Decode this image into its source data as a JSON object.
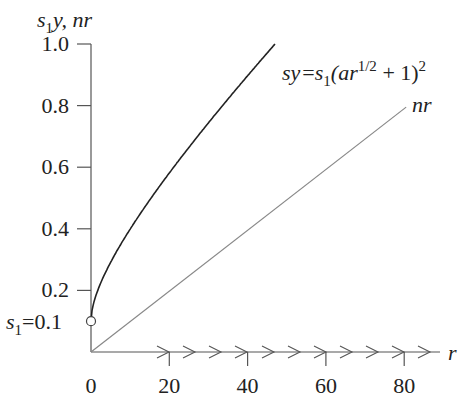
{
  "chart_data": {
    "type": "line",
    "title": "",
    "xlabel": "r",
    "ylabel": "s1y, nr",
    "ylabel_parts": {
      "s": "s",
      "sub": "1",
      "rest": "y, nr"
    },
    "xlim": [
      0,
      90
    ],
    "ylim": [
      0,
      1.0
    ],
    "x_ticks": [
      0,
      20,
      40,
      60,
      80
    ],
    "x_tick_labels": [
      "0",
      "20",
      "40",
      "60",
      "80"
    ],
    "y_ticks": [
      0.2,
      0.4,
      0.6,
      0.8,
      1.0
    ],
    "y_tick_labels": [
      "0.2",
      "0.4",
      "0.6",
      "0.8",
      "1.0"
    ],
    "grid": false,
    "legend": "none",
    "series": [
      {
        "name": "sy = s1(ar^(1/2) + 1)^2",
        "label_display": {
          "lhs": "sy",
          "eq": "=",
          "s": "s",
          "sub": "1",
          "open": "(ar",
          "sup": "1/2",
          "mid": " + 1)",
          "sup2": "2"
        },
        "color": "#222222",
        "params": {
          "s1": 0.1,
          "a": 0.315
        },
        "x": [
          0,
          1,
          2,
          5,
          10,
          15,
          20,
          25,
          30,
          35,
          40,
          45,
          47
        ],
        "values": [
          0.1,
          0.173,
          0.207,
          0.278,
          0.362,
          0.432,
          0.497,
          0.559,
          0.619,
          0.678,
          0.737,
          0.794,
          0.817
        ]
      },
      {
        "name": "nr",
        "color": "#777777",
        "params": {
          "n": 0.01
        },
        "x": [
          0,
          80
        ],
        "values": [
          0,
          0.8
        ]
      }
    ],
    "annotations": [
      {
        "text": "s1 = 0.1",
        "parts": {
          "s": "s",
          "sub": "1",
          "rest": "=0.1"
        },
        "x": 0,
        "y": 0.1,
        "marker": "open-circle"
      },
      {
        "text": "x-axis flow arrows",
        "count": 9,
        "direction": "right"
      }
    ]
  }
}
